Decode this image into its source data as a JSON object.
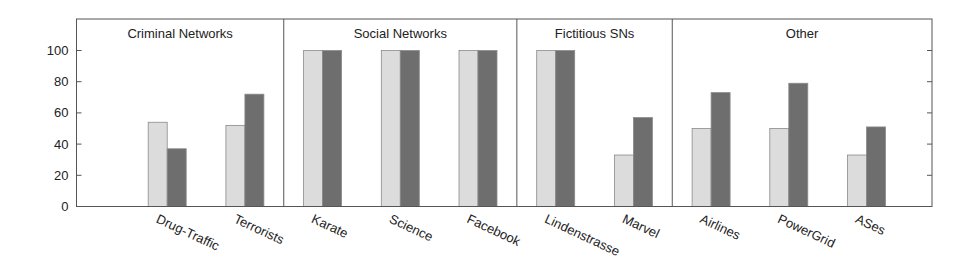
{
  "chart_data": {
    "type": "bar",
    "title": "",
    "xlabel": "",
    "ylabel": "",
    "ylim": [
      0,
      120
    ],
    "yticks": [
      0,
      20,
      40,
      60,
      80,
      100
    ],
    "grid": false,
    "legend": null,
    "groups": [
      {
        "name": "Criminal Networks",
        "categories": [
          "",
          "Drug-Traffic",
          "Terrorists"
        ]
      },
      {
        "name": "Social Networks",
        "categories": [
          "Karate",
          "Science",
          "Facebook"
        ]
      },
      {
        "name": "Fictitious SNs",
        "categories": [
          "Lindenstrasse",
          "Marvel"
        ]
      },
      {
        "name": "Other",
        "categories": [
          "Airlines",
          "PowerGrid",
          "ASes"
        ]
      }
    ],
    "categories": [
      "",
      "Drug-Traffic",
      "Terrorists",
      "Karate",
      "Science",
      "Facebook",
      "Lindenstrasse",
      "Marvel",
      "Airlines",
      "PowerGrid",
      "ASes"
    ],
    "series": [
      {
        "name": "series-light",
        "color": "#dcdcdc",
        "values": [
          null,
          54,
          52,
          100,
          100,
          100,
          100,
          33,
          50,
          50,
          33
        ]
      },
      {
        "name": "series-dark",
        "color": "#6e6e6e",
        "values": [
          null,
          37,
          72,
          100,
          100,
          100,
          100,
          57,
          73,
          79,
          51
        ]
      }
    ]
  }
}
